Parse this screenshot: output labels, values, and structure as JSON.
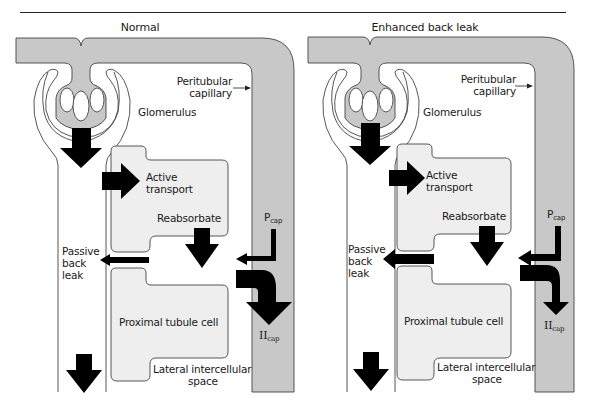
{
  "colors": {
    "capillary_fill": "#c8c8c8",
    "cell_fill": "#eeeeee",
    "arrow": "#000000",
    "outline": "#444444",
    "background": "#ffffff"
  },
  "panels": [
    {
      "title": "Normal",
      "labels": {
        "peritubular_line1": "Peritubular",
        "peritubular_line2": "capillary",
        "glomerulus": "Glomerulus",
        "active_line1": "Active",
        "active_line2": "transport",
        "reabsorbate": "Reabsorbate",
        "passive_line1": "Passive",
        "passive_line2": "back",
        "passive_line3": "leak",
        "proximal_cell": "Proximal tubule cell",
        "lateral_line1": "Lateral intercellular",
        "lateral_line2": "space",
        "p_cap_symbol": "P",
        "p_cap_sub": "cap",
        "pi_cap_symbol": "II",
        "pi_cap_sub": "cap"
      },
      "back_leak_arrow": "thin",
      "pi_cap_arrow": "thick"
    },
    {
      "title": "Enhanced back leak",
      "labels": {
        "peritubular_line1": "Peritubular",
        "peritubular_line2": "capillary",
        "glomerulus": "Glomerulus",
        "active_line1": "Active",
        "active_line2": "transport",
        "reabsorbate": "Reabsorbate",
        "passive_line1": "Passive",
        "passive_line2": "back",
        "passive_line3": "leak",
        "proximal_cell": "Proximal tubule cell",
        "lateral_line1": "Lateral intercellular",
        "lateral_line2": "space",
        "p_cap_symbol": "P",
        "p_cap_sub": "cap",
        "pi_cap_symbol": "II",
        "pi_cap_sub": "cap"
      },
      "back_leak_arrow": "thick",
      "pi_cap_arrow": "thin"
    }
  ]
}
